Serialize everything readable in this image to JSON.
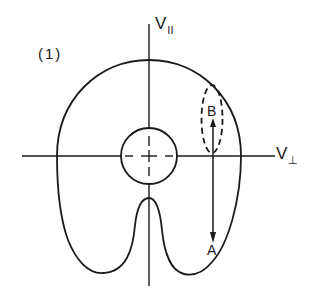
{
  "figure": {
    "panel_label": "(1)",
    "axes": {
      "vertical": {
        "label": "V",
        "subscript": "II"
      },
      "horizontal": {
        "label": "V",
        "subscript": "⊥"
      }
    },
    "points": {
      "b": {
        "label": "B"
      },
      "a": {
        "label": "A"
      }
    },
    "elements": [
      "outer-distribution-contour",
      "inner-loss-circle",
      "dashed-ellipse-region",
      "double-arrow-B-to-A"
    ],
    "colors": {
      "line": "#1a1a1a",
      "background": "#ffffff"
    }
  }
}
